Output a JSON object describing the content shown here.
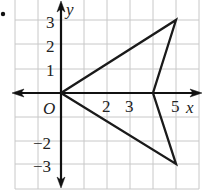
{
  "figure": {
    "bullet": "•",
    "axes": {
      "x_label": "x",
      "y_label": "y",
      "origin_label": "O",
      "x_ticks": [
        "2",
        "3",
        "5"
      ],
      "y_ticks_positive": [
        "1",
        "2",
        "3"
      ],
      "y_ticks_negative": [
        "−2",
        "−3"
      ]
    },
    "grid": {
      "x_range": [
        -2,
        6
      ],
      "y_range": [
        -4,
        3
      ],
      "line_color": "#c8c8c8"
    },
    "polygon": {
      "vertices": [
        [
          0,
          0
        ],
        [
          5,
          3
        ],
        [
          4,
          0
        ],
        [
          5,
          -3
        ]
      ],
      "stroke_color": "#1a1a1a"
    }
  }
}
